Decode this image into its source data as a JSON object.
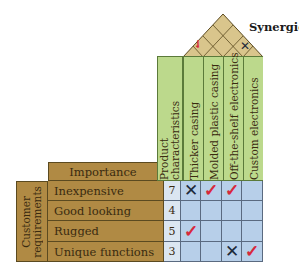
{
  "roof": {
    "label": "Synergies",
    "marks": [
      {
        "between": [
          "Thicker casing",
          "Molded plastic casing"
        ],
        "symbol": "✓",
        "type": "check"
      },
      {
        "between": [
          "Off-the-shelf electronics",
          "Custom electronics"
        ],
        "symbol": "✕",
        "type": "cross"
      }
    ]
  },
  "product_characteristics": {
    "header": "Product characteristics",
    "header_line1": "Product",
    "header_line2": "characteristics",
    "columns": [
      "Thicker casing",
      "Molded plastic casing",
      "Off-the-shelf electronics",
      "Custom electronics"
    ]
  },
  "importance_header": "Importance",
  "customer_requirements": {
    "header_line1": "Customer",
    "header_line2": "requirements",
    "rows": [
      {
        "label": "Inexpensive",
        "importance": "7",
        "cells": [
          "✕",
          "✓",
          "✓",
          ""
        ]
      },
      {
        "label": "Good looking",
        "importance": "4",
        "cells": [
          "",
          "",
          "",
          ""
        ]
      },
      {
        "label": "Rugged",
        "importance": "5",
        "cells": [
          "✓",
          "",
          "",
          ""
        ]
      },
      {
        "label": "Unique functions",
        "importance": "3",
        "cells": [
          "",
          "",
          "✕",
          "✓"
        ]
      }
    ]
  },
  "colors": {
    "roof": "#d9c58c",
    "requirements": "#b08a44",
    "characteristics": "#bcd98c",
    "matrix": "#b7cfe9",
    "check": "#d8283a",
    "cross": "#1e2a3a"
  }
}
